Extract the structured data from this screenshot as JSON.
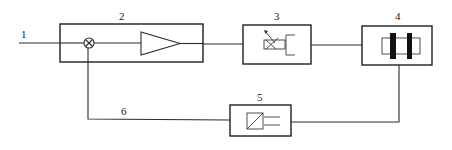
{
  "diagram": {
    "type": "block-diagram",
    "labels": {
      "input": "1",
      "controller_box": "2",
      "actuator_box": "3",
      "process_box": "4",
      "sensor_box": "5",
      "feedback_line": "6"
    },
    "blocks": [
      {
        "id": "2",
        "role": "controller",
        "contains": [
          "summing-junction",
          "amplifier"
        ]
      },
      {
        "id": "3",
        "role": "actuator",
        "symbol": "adjustable-valve"
      },
      {
        "id": "4",
        "role": "process",
        "symbol": "capacitor-plates"
      },
      {
        "id": "5",
        "role": "sensor/transducer",
        "symbol": "converter"
      }
    ],
    "connections": [
      {
        "from": "1",
        "to": "summing-junction"
      },
      {
        "from": "summing-junction",
        "to": "amplifier"
      },
      {
        "from": "2",
        "to": "3"
      },
      {
        "from": "3",
        "to": "4"
      },
      {
        "from": "4",
        "to": "5"
      },
      {
        "from": "5",
        "to": "summing-junction",
        "via": "6"
      }
    ]
  }
}
